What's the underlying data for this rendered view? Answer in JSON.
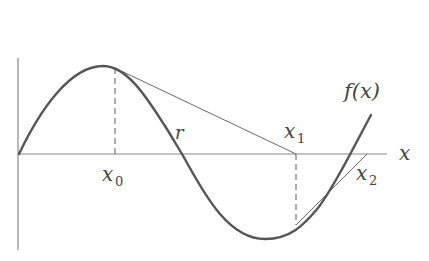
{
  "diagram": {
    "function_label": "f(x)",
    "axis_label_x": "x",
    "labels": {
      "x0": {
        "base": "x",
        "sub": "0"
      },
      "x1": {
        "base": "x",
        "sub": "1"
      },
      "x2": {
        "base": "x",
        "sub": "2"
      },
      "root": "r"
    },
    "colors": {
      "curve": "#555555",
      "axis": "#8a8a8a",
      "tangent": "#6a6a6a",
      "dashed": "#777777",
      "text": "#444444",
      "background": "#ffffff"
    },
    "geometry": {
      "y_axis": {
        "x": 18,
        "y_top": 58,
        "y_bottom": 250
      },
      "x_axis": {
        "y": 154,
        "x_left": 18,
        "x_right": 387
      },
      "curve_points": [
        [
          19,
          154
        ],
        [
          103,
          66
        ],
        [
          182,
          154
        ],
        [
          265,
          239
        ],
        [
          371,
          115
        ]
      ],
      "tangent_at_x0": {
        "from": [
          115,
          68
        ],
        "to": [
          296,
          154
        ]
      },
      "tangent_at_x1": {
        "from": [
          296,
          225
        ],
        "to": [
          367,
          154
        ]
      },
      "dashed_x0": {
        "x": 115,
        "y1": 68,
        "y2": 154
      },
      "dashed_x1": {
        "x": 296,
        "y1": 154,
        "y2": 225
      }
    }
  }
}
